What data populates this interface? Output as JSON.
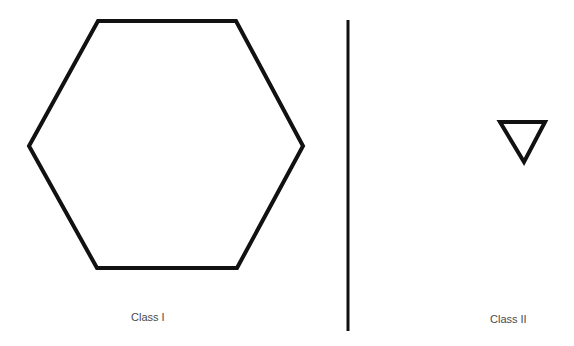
{
  "diagram": {
    "stroke_color": "#111111",
    "label_color": "#4a4a4a",
    "panels": [
      {
        "name": "class-1",
        "label": "Class I",
        "shape": "hexagon",
        "points": "98,21 236,21 303,146 237,268 97,268 29,146"
      },
      {
        "name": "class-2",
        "label": "Class II",
        "shape": "triangle",
        "points": "500,122 545,122 524,162"
      }
    ],
    "divider": {
      "x": 348,
      "y1": 20,
      "y2": 331
    }
  }
}
